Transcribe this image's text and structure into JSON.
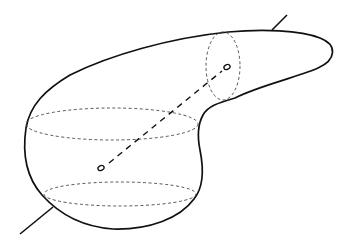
{
  "diagram": {
    "colors": {
      "background": "#ffffff",
      "stroke": "#111111",
      "dashed": "#444444"
    },
    "elements": [
      "body-outline",
      "rotation-axis",
      "upper-point",
      "lower-point",
      "hidden-axis-segment",
      "vertical-cross-section",
      "middle-cross-section",
      "bottom-cross-section"
    ]
  }
}
